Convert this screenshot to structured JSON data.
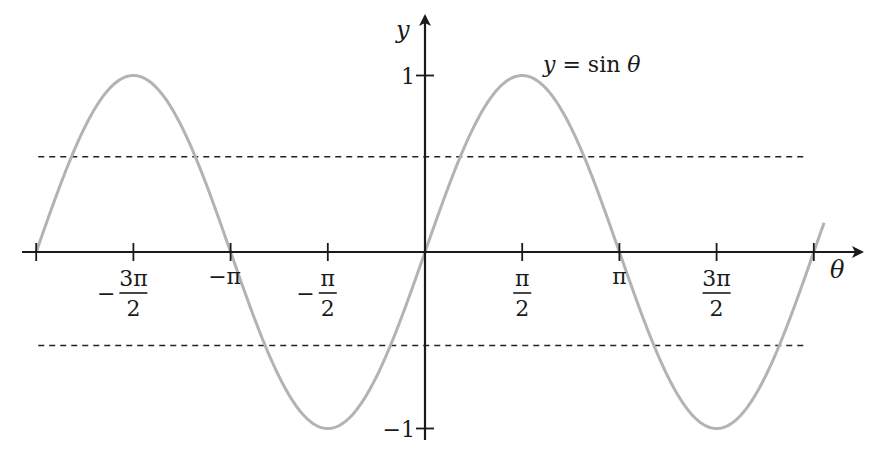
{
  "chart_data": {
    "type": "line",
    "title": "",
    "function_label": "y = sin θ",
    "xlabel": "θ",
    "ylabel": "y",
    "x_ticks": [
      {
        "value": -6.2832,
        "label": ""
      },
      {
        "value": -4.7124,
        "label": "−3π/2",
        "num": "3π",
        "den": "2",
        "neg": true
      },
      {
        "value": -3.1416,
        "label": "−π",
        "num": "−π",
        "den": "",
        "neg": false
      },
      {
        "value": -1.5708,
        "label": "−π/2",
        "num": "π",
        "den": "2",
        "neg": true
      },
      {
        "value": 1.5708,
        "label": "π/2",
        "num": "π",
        "den": "2",
        "neg": false
      },
      {
        "value": 3.1416,
        "label": "π",
        "num": "π",
        "den": "",
        "neg": false
      },
      {
        "value": 4.7124,
        "label": "3π/2",
        "num": "3π",
        "den": "2",
        "neg": false
      },
      {
        "value": 6.2832,
        "label": ""
      }
    ],
    "y_ticks": [
      {
        "value": 1,
        "label": "1"
      },
      {
        "value": -1,
        "label": "−1"
      }
    ],
    "xlim": [
      -6.3,
      6.45
    ],
    "ylim": [
      -1.0,
      1.0
    ],
    "grid": false,
    "legend": "none",
    "series": [
      {
        "name": "y = sin θ",
        "color": "#b3b3b3",
        "function": "sin",
        "x_range": [
          -6.2832,
          6.45
        ],
        "x": [
          -6.2832,
          -4.7124,
          -3.1416,
          -1.5708,
          0,
          1.5708,
          3.1416,
          4.7124,
          6.2832
        ],
        "values": [
          0,
          1,
          0,
          -1,
          0,
          1,
          0,
          -1,
          0
        ]
      }
    ],
    "reference_lines": [
      {
        "type": "horizontal",
        "y": 0.54,
        "style": "dashed",
        "color": "#222222",
        "x_range": [
          -6.25,
          6.15
        ]
      },
      {
        "type": "horizontal",
        "y": -0.53,
        "style": "dashed",
        "color": "#222222",
        "x_range": [
          -6.25,
          6.15
        ]
      }
    ]
  },
  "labels": {
    "function": "y = sin θ",
    "x_axis": "θ",
    "y_axis": "y",
    "y_tick_pos": "1",
    "y_tick_neg": "−1"
  },
  "colors": {
    "curve": "#b3b3b3",
    "axis": "#1a1a1a",
    "dashed": "#222222"
  }
}
